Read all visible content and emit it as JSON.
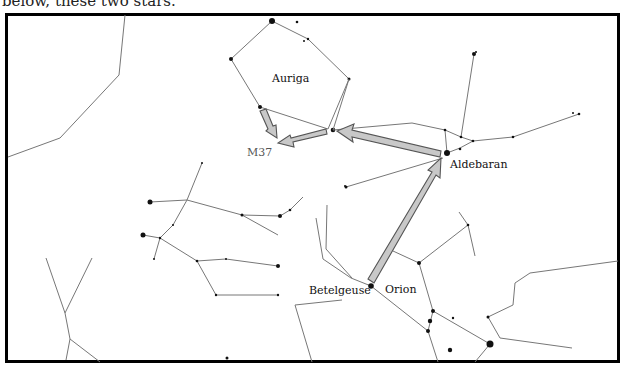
{
  "caption": {
    "top_text": "below, these two stars.",
    "right_text": "...and seasonally visible"
  },
  "chart": {
    "title": "",
    "labels": {
      "auriga": "Auriga",
      "m37": "M37",
      "aldebaran": "Aldebaran",
      "betelgeuse": "Betelgeuse",
      "orion": "Orion"
    },
    "colors": {
      "constellation_line": "#777777",
      "arrow_fill": "#c8c8c8",
      "arrow_stroke": "#555555",
      "frame": "#000000"
    },
    "arrows": [
      {
        "from": "Betelgeuse",
        "to": "Aldebaran"
      },
      {
        "from": "Aldebaran",
        "to": "Auriga (El Nath)"
      },
      {
        "from": "El Nath",
        "to": "M37"
      },
      {
        "from": "Auriga star",
        "to": "M37"
      }
    ]
  }
}
